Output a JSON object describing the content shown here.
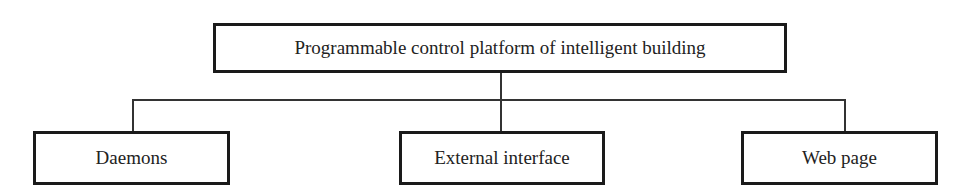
{
  "diagram": {
    "type": "hierarchy",
    "root": {
      "label": "Programmable control platform of intelligent building"
    },
    "children": [
      {
        "label": "Daemons"
      },
      {
        "label": "External interface"
      },
      {
        "label": "Web page"
      }
    ]
  }
}
